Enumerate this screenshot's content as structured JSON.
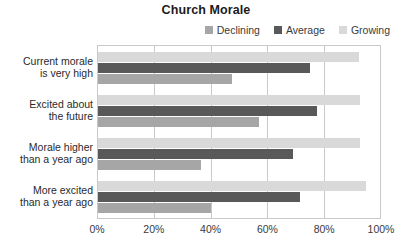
{
  "chart_data": {
    "type": "bar",
    "orientation": "horizontal",
    "title": "Church Morale",
    "xlabel": "",
    "ylabel": "",
    "xlim": [
      0,
      100
    ],
    "grid": true,
    "legend_position": "top-right",
    "categories": [
      "Current morale is very high",
      "Excited about the future",
      "Morale higher than a year ago",
      "More excited than a year ago"
    ],
    "category_lines": [
      [
        "Current morale",
        "is very high"
      ],
      [
        "Excited about",
        "the future"
      ],
      [
        "Morale higher",
        "than a year ago"
      ],
      [
        "More excited",
        "than a year ago"
      ]
    ],
    "tick_labels": [
      "0%",
      "20%",
      "40%",
      "60%",
      "80%",
      "100%"
    ],
    "tick_values": [
      0,
      20,
      40,
      60,
      80,
      100
    ],
    "series": [
      {
        "name": "Declining",
        "color": "#a6a6a6",
        "values": [
          47.5,
          57.0,
          36.5,
          40.0
        ]
      },
      {
        "name": "Average",
        "color": "#595959",
        "values": [
          75.0,
          77.5,
          69.0,
          71.5
        ]
      },
      {
        "name": "Growing",
        "color": "#d9d9d9",
        "values": [
          92.5,
          93.0,
          93.0,
          95.0
        ]
      }
    ],
    "bar_draw_order": [
      "Growing",
      "Average",
      "Declining"
    ]
  },
  "colors": {
    "declining": "#a6a6a6",
    "average": "#595959",
    "growing": "#d9d9d9",
    "axis": "#c9c9c9",
    "text": "#2a2a2a",
    "background": "#ffffff"
  }
}
